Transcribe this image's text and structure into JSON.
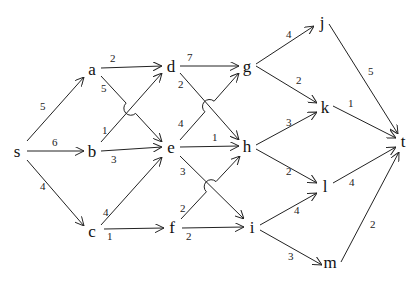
{
  "diagram": {
    "type": "directed-weighted-graph",
    "colors": {
      "stroke": "#222222",
      "text": "#111111",
      "background": "#ffffff"
    },
    "nodes": [
      {
        "id": "s",
        "label": "s",
        "x": 17,
        "y": 152
      },
      {
        "id": "a",
        "label": "a",
        "x": 92,
        "y": 70
      },
      {
        "id": "b",
        "label": "b",
        "x": 92,
        "y": 152
      },
      {
        "id": "c",
        "label": "c",
        "x": 92,
        "y": 232
      },
      {
        "id": "d",
        "label": "d",
        "x": 171,
        "y": 67
      },
      {
        "id": "e",
        "label": "e",
        "x": 171,
        "y": 148
      },
      {
        "id": "f",
        "label": "f",
        "x": 172,
        "y": 228
      },
      {
        "id": "g",
        "label": "g",
        "x": 247,
        "y": 67
      },
      {
        "id": "h",
        "label": "h",
        "x": 247,
        "y": 147
      },
      {
        "id": "i",
        "label": "i",
        "x": 252,
        "y": 228
      },
      {
        "id": "j",
        "label": "j",
        "x": 322,
        "y": 23
      },
      {
        "id": "k",
        "label": "k",
        "x": 325,
        "y": 108
      },
      {
        "id": "l",
        "label": "l",
        "x": 325,
        "y": 187
      },
      {
        "id": "m",
        "label": "m",
        "x": 330,
        "y": 263
      },
      {
        "id": "t",
        "label": "t",
        "x": 403,
        "y": 142
      }
    ],
    "edges": [
      {
        "from": "s",
        "to": "a",
        "weight": "5",
        "x1": 27,
        "y1": 141,
        "x2": 84,
        "y2": 77,
        "lx": 40,
        "ly": 110
      },
      {
        "from": "s",
        "to": "b",
        "weight": "6",
        "x1": 27,
        "y1": 151,
        "x2": 84,
        "y2": 151,
        "lx": 52,
        "ly": 146
      },
      {
        "from": "s",
        "to": "c",
        "weight": "4",
        "x1": 27,
        "y1": 160,
        "x2": 84,
        "y2": 226,
        "lx": 40,
        "ly": 190
      },
      {
        "from": "a",
        "to": "d",
        "weight": "2",
        "x1": 101,
        "y1": 68,
        "x2": 162,
        "y2": 66,
        "lx": 110,
        "ly": 62
      },
      {
        "from": "a",
        "to": "e",
        "weight": "5",
        "x1": 101,
        "y1": 76,
        "x2": 162,
        "y2": 142,
        "lx": 101,
        "ly": 92,
        "hop": true
      },
      {
        "from": "b",
        "to": "d",
        "weight": "1",
        "x1": 101,
        "y1": 142,
        "x2": 162,
        "y2": 73,
        "lx": 102,
        "ly": 134
      },
      {
        "from": "b",
        "to": "e",
        "weight": "3",
        "x1": 101,
        "y1": 151,
        "x2": 162,
        "y2": 147,
        "lx": 111,
        "ly": 163
      },
      {
        "from": "c",
        "to": "e",
        "weight": "4",
        "x1": 101,
        "y1": 225,
        "x2": 162,
        "y2": 157,
        "lx": 103,
        "ly": 216
      },
      {
        "from": "c",
        "to": "f",
        "weight": "1",
        "x1": 104,
        "y1": 229,
        "x2": 164,
        "y2": 228,
        "lx": 107,
        "ly": 240
      },
      {
        "from": "d",
        "to": "g",
        "weight": "7",
        "x1": 180,
        "y1": 66,
        "x2": 239,
        "y2": 66,
        "lx": 187,
        "ly": 61
      },
      {
        "from": "d",
        "to": "h",
        "weight": "2",
        "x1": 180,
        "y1": 73,
        "x2": 239,
        "y2": 140,
        "lx": 178,
        "ly": 88
      },
      {
        "from": "e",
        "to": "g",
        "weight": "4",
        "x1": 180,
        "y1": 140,
        "x2": 239,
        "y2": 73,
        "lx": 178,
        "ly": 127,
        "hop": true
      },
      {
        "from": "e",
        "to": "h",
        "weight": "1",
        "x1": 180,
        "y1": 147,
        "x2": 239,
        "y2": 146,
        "lx": 212,
        "ly": 141
      },
      {
        "from": "e",
        "to": "i",
        "weight": "3",
        "x1": 180,
        "y1": 156,
        "x2": 244,
        "y2": 219,
        "lx": 180,
        "ly": 175
      },
      {
        "from": "f",
        "to": "h",
        "weight": "2",
        "x1": 181,
        "y1": 219,
        "x2": 240,
        "y2": 156,
        "lx": 180,
        "ly": 212,
        "hop": true
      },
      {
        "from": "f",
        "to": "i",
        "weight": "2",
        "x1": 182,
        "y1": 228,
        "x2": 244,
        "y2": 227,
        "lx": 186,
        "ly": 240
      },
      {
        "from": "g",
        "to": "j",
        "weight": "4",
        "x1": 256,
        "y1": 64,
        "x2": 314,
        "y2": 26,
        "lx": 286,
        "ly": 38
      },
      {
        "from": "g",
        "to": "k",
        "weight": "2",
        "x1": 256,
        "y1": 66,
        "x2": 317,
        "y2": 103,
        "lx": 296,
        "ly": 84
      },
      {
        "from": "h",
        "to": "k",
        "weight": "3",
        "x1": 256,
        "y1": 145,
        "x2": 317,
        "y2": 112,
        "lx": 286,
        "ly": 126
      },
      {
        "from": "h",
        "to": "l",
        "weight": "2",
        "x1": 256,
        "y1": 149,
        "x2": 317,
        "y2": 183,
        "lx": 286,
        "ly": 175
      },
      {
        "from": "i",
        "to": "l",
        "weight": "4",
        "x1": 260,
        "y1": 225,
        "x2": 317,
        "y2": 193,
        "lx": 294,
        "ly": 214
      },
      {
        "from": "i",
        "to": "m",
        "weight": "3",
        "x1": 260,
        "y1": 230,
        "x2": 322,
        "y2": 265,
        "lx": 288,
        "ly": 260
      },
      {
        "from": "j",
        "to": "t",
        "weight": "5",
        "x1": 329,
        "y1": 24,
        "x2": 398,
        "y2": 134,
        "lx": 368,
        "ly": 75
      },
      {
        "from": "k",
        "to": "t",
        "weight": "1",
        "x1": 333,
        "y1": 106,
        "x2": 396,
        "y2": 138,
        "lx": 348,
        "ly": 107
      },
      {
        "from": "l",
        "to": "t",
        "weight": "4",
        "x1": 333,
        "y1": 183,
        "x2": 396,
        "y2": 147,
        "lx": 349,
        "ly": 186
      },
      {
        "from": "m",
        "to": "t",
        "weight": "2",
        "x1": 341,
        "y1": 262,
        "x2": 399,
        "y2": 152,
        "lx": 370,
        "ly": 228
      }
    ]
  }
}
